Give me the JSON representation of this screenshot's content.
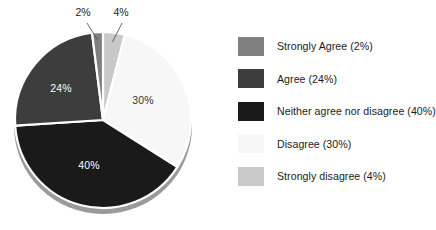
{
  "chart_data": {
    "type": "pie",
    "title": "",
    "units": "percent",
    "legend_position": "right",
    "categories": [
      "Strongly Agree",
      "Agree",
      "Neither agree nor disagree",
      "Disagree",
      "Strongly disagree"
    ],
    "values": [
      2,
      24,
      40,
      30,
      4
    ],
    "slice_labels": [
      "2%",
      "24%",
      "40%",
      "30%",
      "4%"
    ],
    "legend_labels": [
      "Strongly Agree (2%)",
      "Agree (24%)",
      "Neither agree nor disagree (40%)",
      "Disagree (30%)",
      "Strongly disagree (4%)"
    ],
    "colors": [
      "#808080",
      "#3d3d3d",
      "#1a1a1a",
      "#f7f7f7",
      "#c9c9c9"
    ],
    "label_text_colors": [
      "#222222",
      "#ffffff",
      "#ffffff",
      "#333333",
      "#222222"
    ],
    "background": "#ffffff",
    "separator_color": "#ffffff",
    "shadow_color": "#9a9a9a",
    "draw_order_clockwise_from_top": [
      "Strongly disagree",
      "Disagree",
      "Neither agree nor disagree",
      "Agree",
      "Strongly Agree"
    ]
  },
  "pie": {
    "inner_labels": [
      {
        "name": "slice-label-disagree",
        "text": "30%",
        "x": 143,
        "y": 104,
        "fill": "#333333"
      },
      {
        "name": "slice-label-neither",
        "text": "40%",
        "x": 89,
        "y": 169,
        "fill": "#ffffff"
      },
      {
        "name": "slice-label-agree",
        "text": "24%",
        "x": 61,
        "y": 92,
        "fill": "#ffffff"
      }
    ],
    "callouts": [
      {
        "name": "callout-strongly-agree",
        "text": "2%",
        "x": 83,
        "y": 16
      },
      {
        "name": "callout-strongly-disagree",
        "text": "4%",
        "x": 121,
        "y": 16
      }
    ]
  },
  "legend": {
    "items": [
      {
        "label": "Strongly Agree (2%)",
        "color": "#808080"
      },
      {
        "label": "Agree (24%)",
        "color": "#3d3d3d"
      },
      {
        "label": "Neither agree nor disagree (40%)",
        "color": "#1a1a1a"
      },
      {
        "label": "Disagree (30%)",
        "color": "#f7f7f7"
      },
      {
        "label": "Strongly disagree (4%)",
        "color": "#c9c9c9"
      }
    ]
  }
}
